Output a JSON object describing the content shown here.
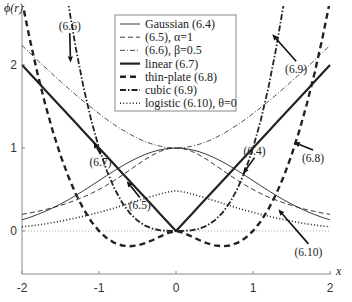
{
  "chart_data": {
    "type": "line",
    "title": "",
    "xlabel": "x",
    "ylabel": "ϕ(r)",
    "xlim": [
      -2,
      2
    ],
    "ylim": [
      -0.52,
      2.7
    ],
    "grid": false,
    "legend_position": "upper center (inside)",
    "x_ticks": [
      "-2",
      "-1",
      "0",
      "1",
      "2"
    ],
    "x_tick_values": [
      -2,
      -1,
      0,
      1,
      2
    ],
    "y_ticks": [
      "0",
      "1",
      "2"
    ],
    "y_tick_values": [
      0,
      1,
      2
    ],
    "x": [
      -2.0,
      -1.9,
      -1.8,
      -1.7,
      -1.6,
      -1.5,
      -1.4,
      -1.3,
      -1.2,
      -1.1,
      -1.0,
      -0.9,
      -0.8,
      -0.7,
      -0.6,
      -0.5,
      -0.4,
      -0.3,
      -0.2,
      -0.1,
      0.0,
      0.1,
      0.2,
      0.3,
      0.4,
      0.5,
      0.6,
      0.7,
      0.8,
      0.9,
      1.0,
      1.1,
      1.2,
      1.3,
      1.4,
      1.5,
      1.6,
      1.7,
      1.8,
      1.9,
      2.0
    ],
    "series": [
      {
        "name": "Gaussian (6.4)",
        "style": "thin-solid",
        "values": [
          0.135,
          0.164,
          0.198,
          0.236,
          0.278,
          0.325,
          0.375,
          0.43,
          0.487,
          0.546,
          0.607,
          0.667,
          0.726,
          0.783,
          0.835,
          0.882,
          0.923,
          0.956,
          0.98,
          0.995,
          1.0,
          0.995,
          0.98,
          0.956,
          0.923,
          0.882,
          0.835,
          0.783,
          0.726,
          0.667,
          0.607,
          0.546,
          0.487,
          0.43,
          0.375,
          0.325,
          0.278,
          0.236,
          0.198,
          0.164,
          0.135
        ]
      },
      {
        "name": "(6.5), α=1",
        "style": "thin-dashed",
        "values": [
          0.2,
          0.217,
          0.236,
          0.257,
          0.281,
          0.308,
          0.338,
          0.372,
          0.41,
          0.452,
          0.5,
          0.552,
          0.61,
          0.671,
          0.735,
          0.8,
          0.862,
          0.917,
          0.962,
          0.99,
          1.0,
          0.99,
          0.962,
          0.917,
          0.862,
          0.8,
          0.735,
          0.671,
          0.61,
          0.552,
          0.5,
          0.452,
          0.41,
          0.372,
          0.338,
          0.308,
          0.281,
          0.257,
          0.236,
          0.217,
          0.2
        ]
      },
      {
        "name": "(6.6), β=0.5",
        "style": "thin-dashdot",
        "values": [
          2.236,
          2.147,
          2.059,
          1.972,
          1.887,
          1.803,
          1.72,
          1.64,
          1.562,
          1.487,
          1.414,
          1.345,
          1.281,
          1.221,
          1.166,
          1.118,
          1.077,
          1.044,
          1.02,
          1.005,
          1.0,
          1.005,
          1.02,
          1.044,
          1.077,
          1.118,
          1.166,
          1.221,
          1.281,
          1.345,
          1.414,
          1.487,
          1.562,
          1.64,
          1.72,
          1.803,
          1.887,
          1.972,
          2.059,
          2.147,
          2.236
        ]
      },
      {
        "name": "linear (6.7)",
        "style": "thick-solid",
        "values": [
          2.0,
          1.9,
          1.8,
          1.7,
          1.6,
          1.5,
          1.4,
          1.3,
          1.2,
          1.1,
          1.0,
          0.9,
          0.8,
          0.7,
          0.6,
          0.5,
          0.4,
          0.3,
          0.2,
          0.1,
          0.0,
          0.1,
          0.2,
          0.3,
          0.4,
          0.5,
          0.6,
          0.7,
          0.8,
          0.9,
          1.0,
          1.1,
          1.2,
          1.3,
          1.4,
          1.5,
          1.6,
          1.7,
          1.8,
          1.9,
          2.0
        ]
      },
      {
        "name": "thin-plate (6.8)",
        "style": "thick-dashed",
        "values": [
          2.773,
          2.317,
          1.904,
          1.533,
          1.203,
          0.912,
          0.66,
          0.443,
          0.263,
          0.115,
          0.0,
          -0.085,
          -0.143,
          -0.175,
          -0.184,
          -0.173,
          -0.147,
          -0.108,
          -0.064,
          -0.023,
          0.0,
          -0.023,
          -0.064,
          -0.108,
          -0.147,
          -0.173,
          -0.184,
          -0.175,
          -0.143,
          -0.085,
          0.0,
          0.115,
          0.263,
          0.443,
          0.66,
          0.912,
          1.203,
          1.533,
          1.904,
          2.317,
          2.773
        ]
      },
      {
        "name": "cubic (6.9)",
        "style": "thick-dashdot",
        "values": [
          8.0,
          6.859,
          5.832,
          4.913,
          4.096,
          3.375,
          2.744,
          2.197,
          1.728,
          1.331,
          1.0,
          0.729,
          0.512,
          0.343,
          0.216,
          0.125,
          0.064,
          0.027,
          0.008,
          0.001,
          0.0,
          0.001,
          0.008,
          0.027,
          0.064,
          0.125,
          0.216,
          0.343,
          0.512,
          0.729,
          1.0,
          1.331,
          1.728,
          2.197,
          2.744,
          3.375,
          4.096,
          4.913,
          5.832,
          6.859,
          8.0
        ]
      },
      {
        "name": "logistic (6.10), θ=0",
        "style": "thick-dotted",
        "values": [
          0.05,
          0.06,
          0.072,
          0.086,
          0.101,
          0.118,
          0.137,
          0.157,
          0.178,
          0.2,
          0.224,
          0.25,
          0.277,
          0.305,
          0.334,
          0.364,
          0.393,
          0.421,
          0.448,
          0.47,
          0.485,
          0.47,
          0.448,
          0.421,
          0.393,
          0.364,
          0.334,
          0.305,
          0.277,
          0.25,
          0.224,
          0.2,
          0.178,
          0.157,
          0.137,
          0.118,
          0.101,
          0.086,
          0.072,
          0.06,
          0.05
        ]
      }
    ],
    "reference_lines": [
      {
        "name": "zero line",
        "y": 0,
        "style": "thin-dotted"
      }
    ],
    "annotations": [
      {
        "text": "(6.6)",
        "label_xy": [
          -1.38,
          2.42
        ],
        "arrow_to": [
          -1.37,
          2.03
        ]
      },
      {
        "text": "(6.7)",
        "label_xy": [
          -0.98,
          0.78
        ],
        "arrow_to": [
          -1.07,
          1.07
        ]
      },
      {
        "text": "(6.5)",
        "label_xy": [
          -0.47,
          0.26
        ],
        "arrow_to": [
          -0.64,
          0.6
        ]
      },
      {
        "text": "(6.9)",
        "label_xy": [
          1.56,
          1.9
        ],
        "arrow_to": [
          1.25,
          2.37
        ]
      },
      {
        "text": "(6.4)",
        "label_xy": [
          1.02,
          0.92
        ],
        "arrow_to": [
          0.87,
          0.69
        ]
      },
      {
        "text": "(6.8)",
        "label_xy": [
          1.78,
          0.83
        ],
        "arrow_to": [
          1.53,
          1.07
        ]
      },
      {
        "text": "(6.10)",
        "label_xy": [
          1.72,
          -0.3
        ],
        "arrow_to": [
          1.33,
          0.26
        ]
      }
    ]
  },
  "legend": {
    "items": [
      {
        "label": "Gaussian (6.4)",
        "style": "thin-solid"
      },
      {
        "label": "(6.5), α=1",
        "style": "thin-dashed"
      },
      {
        "label": "(6.6), β=0.5",
        "style": "thin-dashdot"
      },
      {
        "label": "linear (6.7)",
        "style": "thick-solid"
      },
      {
        "label": "thin-plate (6.8)",
        "style": "thick-dashed"
      },
      {
        "label": "cubic (6.9)",
        "style": "thick-dashdot"
      },
      {
        "label": "logistic (6.10), θ=0",
        "style": "thick-dotted"
      }
    ]
  },
  "axes": {
    "y_title": "ϕ(r)",
    "x_title": "x"
  },
  "colors": {
    "curve": "#222222",
    "axis": "#777777",
    "text": "#222222"
  }
}
